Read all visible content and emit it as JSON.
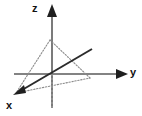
{
  "figure": {
    "width": 142,
    "height": 116,
    "background_color": "#ffffff"
  },
  "axes": {
    "origin": {
      "x": 52,
      "y": 74
    },
    "items": [
      {
        "name": "z",
        "label": "z",
        "color": "#4d4d4d",
        "direction": "up",
        "line": {
          "x1": 52,
          "y1": 12,
          "x2": 52,
          "y2": 108
        },
        "arrow_tip": {
          "x": 52,
          "y": 4
        },
        "label_pos": {
          "x": 32,
          "y": 3
        }
      },
      {
        "name": "y",
        "label": "y",
        "color": "#4d4d4d",
        "direction": "right",
        "line": {
          "x1": 14,
          "y1": 74,
          "x2": 120,
          "y2": 74
        },
        "arrow_tip": {
          "x": 128,
          "y": 74
        },
        "label_pos": {
          "x": 130,
          "y": 67
        }
      },
      {
        "name": "x",
        "label": "x",
        "color": "#333333",
        "direction": "lower-left",
        "line": {
          "x1": 92,
          "y1": 49,
          "x2": 22,
          "y2": 90
        },
        "arrow_tip": {
          "x": 13,
          "y": 95
        },
        "label_pos": {
          "x": 6,
          "y": 100
        }
      }
    ]
  },
  "triangle": {
    "name": "dotted-triangle",
    "style": "dotted",
    "color": "#8c8c8c",
    "vertices": [
      {
        "name": "apex",
        "x": 50,
        "y": 40
      },
      {
        "name": "left-foot",
        "x": 16,
        "y": 93
      },
      {
        "name": "right-foot",
        "x": 90,
        "y": 78
      }
    ]
  },
  "guides": [
    {
      "name": "vertical-drop-line",
      "style": "dotted",
      "color": "#9a9a9a",
      "x1": 52,
      "y1": 74,
      "x2": 52,
      "y2": 108
    }
  ],
  "colors": {
    "axis_gray": "#4d4d4d",
    "axis_dark": "#262626",
    "triangle_gray": "#8c8c8c",
    "label_black": "#111111"
  }
}
